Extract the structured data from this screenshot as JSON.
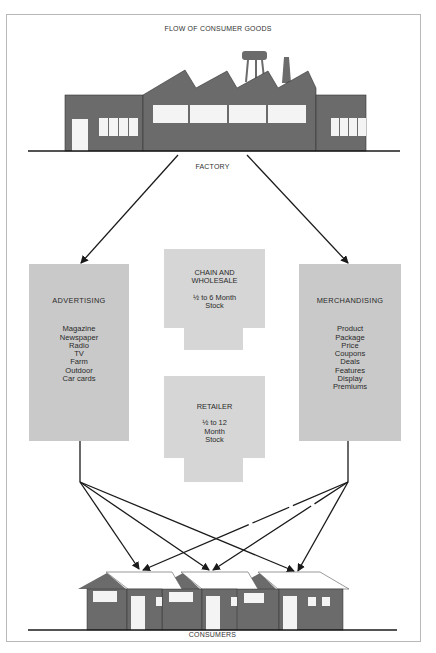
{
  "title": "FLOW OF CONSUMER GOODS",
  "colors": {
    "building": "#6b6b6b",
    "box": "#c9c9c9",
    "stock_box": "#d6d6d6",
    "line": "#1a1a1a",
    "window": "#f4f4f4"
  },
  "nodes": {
    "factory": {
      "label": "FACTORY"
    },
    "advertising": {
      "title": "ADVERTISING",
      "items": [
        "Magazine",
        "Newspaper",
        "Radio",
        "TV",
        "Farm",
        "Outdoor",
        "Car cards"
      ]
    },
    "merchandising": {
      "title": "MERCHANDISING",
      "items": [
        "Product",
        "Package",
        "Price",
        "Coupons",
        "Deals",
        "Features",
        "Display",
        "Premiums"
      ]
    },
    "chain_wholesale": {
      "title_line1": "CHAIN AND",
      "title_line2": "WHOLESALE",
      "stock_line1": "½ to 6 Month",
      "stock_line2": "Stock"
    },
    "retailer": {
      "title": "RETAILER",
      "stock_line1": "½ to 12",
      "stock_line2": "Month",
      "stock_line3": "Stock"
    },
    "consumers": {
      "label": "CONSUMERS"
    }
  },
  "edges": [
    {
      "from": "factory",
      "to": "advertising"
    },
    {
      "from": "factory",
      "to": "merchandising"
    },
    {
      "from": "advertising",
      "to": "consumer-house-1"
    },
    {
      "from": "advertising",
      "to": "consumer-house-2"
    },
    {
      "from": "advertising",
      "to": "consumer-house-3"
    },
    {
      "from": "merchandising",
      "to": "consumer-house-1"
    },
    {
      "from": "merchandising",
      "to": "consumer-house-2"
    },
    {
      "from": "merchandising",
      "to": "consumer-house-3"
    }
  ]
}
